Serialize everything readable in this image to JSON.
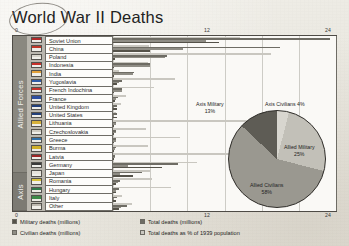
{
  "title": "World War II Deaths",
  "axis": {
    "top_ticks": [
      "0",
      "12",
      "24"
    ],
    "bottom_ticks": [
      "0",
      "12",
      "24"
    ]
  },
  "groups": [
    {
      "name": "Allied Forces",
      "label": "Allied Forces"
    },
    {
      "name": "Axis",
      "label": "Axis"
    }
  ],
  "legend": [
    {
      "label": "Military deaths (millions)",
      "color": "#555249"
    },
    {
      "label": "Total deaths (millions)",
      "color": "#6e6c64"
    },
    {
      "label": "Civilian deaths (millions)",
      "color": "#8f8d85"
    },
    {
      "label": "Total deaths as % of 1939 population",
      "color": "#c9c7c0"
    }
  ],
  "pie": {
    "slices": [
      {
        "label": "Axis Civilians",
        "percent": "4%",
        "value": 4,
        "color": "#d8d6cf"
      },
      {
        "label": "Allied Military",
        "percent": "25%",
        "value": 25,
        "color": "#c2c0b8"
      },
      {
        "label": "Allied Civilians",
        "percent": "58%",
        "value": 58,
        "color": "#9a9890"
      },
      {
        "label": "Axis Military",
        "percent": "13%",
        "value": 13,
        "color": "#5e5c55"
      }
    ],
    "labels": {
      "axis_military": "Axis Military",
      "axis_military_pct": "13%",
      "axis_civilians": "Axis Civilians 4%",
      "allied_military": "Allied Military",
      "allied_military_pct": "25%",
      "allied_civilians": "Allied Civilians",
      "allied_civilians_pct": "58%"
    }
  },
  "chart_data": {
    "type": "bar",
    "title": "World War II Deaths",
    "xlabel": "",
    "ylabel": "",
    "xlim": [
      0,
      24
    ],
    "grid": true,
    "orientation": "horizontal",
    "legend_position": "bottom",
    "categories": [
      "Soviet Union",
      "China",
      "Poland",
      "Indonesia",
      "India",
      "Yugoslavia",
      "French Indochina",
      "France",
      "United Kingdom",
      "United States",
      "Lithuania",
      "Czechoslovakia",
      "Greece",
      "Burma",
      "Latvia",
      "Germany",
      "Japan",
      "Romania",
      "Hungary",
      "Italy",
      "Other"
    ],
    "group_of_category": [
      "Allied Forces",
      "Allied Forces",
      "Allied Forces",
      "Allied Forces",
      "Allied Forces",
      "Allied Forces",
      "Allied Forces",
      "Allied Forces",
      "Allied Forces",
      "Allied Forces",
      "Allied Forces",
      "Allied Forces",
      "Allied Forces",
      "Allied Forces",
      "Allied Forces",
      "Axis",
      "Axis",
      "Axis",
      "Axis",
      "Axis",
      "Axis"
    ],
    "series": [
      {
        "name": "Military deaths (millions)",
        "color": "#555249",
        "values": [
          11.4,
          4.0,
          0.24,
          0.0,
          0.09,
          0.45,
          0.0,
          0.21,
          0.38,
          0.42,
          0.0,
          0.03,
          0.02,
          0.03,
          0.0,
          5.3,
          2.1,
          0.3,
          0.3,
          0.3,
          0.6
        ]
      },
      {
        "name": "Civilian deaths (millions)",
        "color": "#8f8d85",
        "values": [
          10.0,
          7.5,
          5.6,
          4.0,
          2.2,
          0.6,
          1.0,
          0.35,
          0.07,
          0.01,
          0.35,
          0.3,
          0.3,
          0.25,
          0.23,
          1.6,
          0.8,
          0.5,
          0.3,
          0.15,
          0.9
        ]
      },
      {
        "name": "Total deaths (millions)",
        "color": "#6e6c64",
        "values": [
          23.4,
          18.0,
          5.8,
          4.0,
          2.3,
          1.0,
          1.0,
          0.57,
          0.45,
          0.42,
          0.35,
          0.35,
          0.3,
          0.27,
          0.23,
          7.0,
          3.1,
          0.8,
          0.6,
          0.46,
          1.5
        ]
      },
      {
        "name": "Total deaths as % of 1939 population",
        "color": "#c9c7c0",
        "values": [
          13.7,
          3.9,
          17.0,
          3.8,
          0.6,
          6.7,
          4.4,
          1.4,
          0.9,
          0.3,
          14.4,
          3.6,
          7.2,
          3.8,
          12.5,
          9.0,
          4.0,
          4.2,
          6.2,
          1.0,
          2.0
        ]
      }
    ]
  }
}
